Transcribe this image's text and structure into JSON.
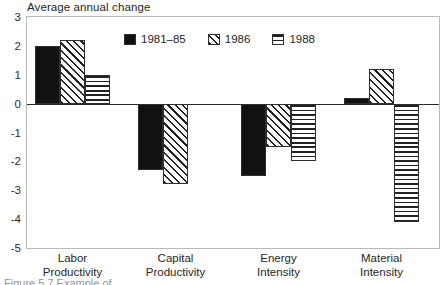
{
  "chart_data": {
    "type": "bar",
    "title": "Average annual change",
    "xlabel": "",
    "ylabel": "",
    "ylim": [
      -5,
      3
    ],
    "ytick_labels": [
      "3",
      "2",
      "1",
      "0",
      "-1",
      "-2",
      "-3",
      "-4",
      "-5"
    ],
    "ytick_values": [
      3,
      2,
      1,
      0,
      -1,
      -2,
      -3,
      -4,
      -5
    ],
    "grid": false,
    "legend_position": "inside-top-center",
    "categories": [
      "Labor\nProductivity",
      "Capital\nProductivity",
      "Energy\nIntensity",
      "Material\nIntensity"
    ],
    "series": [
      {
        "name": "1981–85",
        "fill": "solid",
        "values": [
          2.0,
          -2.3,
          -2.5,
          0.18
        ]
      },
      {
        "name": "1986",
        "fill": "diagonal-hatch",
        "values": [
          2.2,
          -2.8,
          -1.5,
          1.2
        ]
      },
      {
        "name": "1988",
        "fill": "horizontal-lines",
        "values": [
          1.0,
          null,
          -2.0,
          -4.1
        ]
      }
    ]
  },
  "legend": {
    "entries": [
      {
        "label": "1981–85",
        "fill": "solid"
      },
      {
        "label": "1986",
        "fill": "diagonal-hatch"
      },
      {
        "label": "1988",
        "fill": "horizontal-lines"
      }
    ]
  },
  "categories_display": [
    {
      "line1": "Labor",
      "line2": "Productivity"
    },
    {
      "line1": "Capital",
      "line2": "Productivity"
    },
    {
      "line1": "Energy",
      "line2": "Intensity"
    },
    {
      "line1": "Material",
      "line2": "Intensity"
    }
  ],
  "caption": {
    "text": "Figure 5.7  Example of …"
  },
  "colors": {
    "ink": "#111111",
    "frame": "#b9b9b9",
    "axis": "#2b2b2b",
    "background": "#ffffff"
  }
}
